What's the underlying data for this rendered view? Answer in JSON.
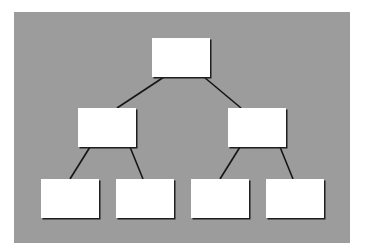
{
  "diagram": {
    "type": "tree",
    "title": "",
    "colors": {
      "background": "#ffffff",
      "panel": "#9c9c9c",
      "node_fill": "#ffffff",
      "edge": "#151515"
    },
    "nodes": [
      {
        "id": "root",
        "label": "",
        "level": 0,
        "order": 0
      },
      {
        "id": "mid-l",
        "label": "",
        "level": 1,
        "order": 0
      },
      {
        "id": "mid-r",
        "label": "",
        "level": 1,
        "order": 1
      },
      {
        "id": "leaf-1",
        "label": "",
        "level": 2,
        "order": 0
      },
      {
        "id": "leaf-2",
        "label": "",
        "level": 2,
        "order": 1
      },
      {
        "id": "leaf-3",
        "label": "",
        "level": 2,
        "order": 2
      },
      {
        "id": "leaf-4",
        "label": "",
        "level": 2,
        "order": 3
      }
    ],
    "edges": [
      {
        "from": "root",
        "to": "mid-l"
      },
      {
        "from": "root",
        "to": "mid-r"
      },
      {
        "from": "mid-l",
        "to": "leaf-1"
      },
      {
        "from": "mid-l",
        "to": "leaf-2"
      },
      {
        "from": "mid-r",
        "to": "leaf-3"
      },
      {
        "from": "mid-r",
        "to": "leaf-4"
      }
    ]
  }
}
